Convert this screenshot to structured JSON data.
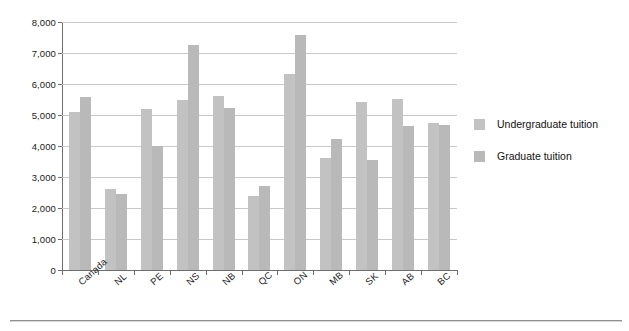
{
  "chart_data": {
    "type": "bar",
    "title": "",
    "subtitle": "",
    "xlabel": "",
    "ylabel": "",
    "ylim": [
      0,
      8000
    ],
    "ytick_labels": [
      "8,000",
      "7,000",
      "6,000",
      "5,000",
      "4,000",
      "3,000",
      "2,000",
      "1,000",
      "0"
    ],
    "ytick_values": [
      8000,
      7000,
      6000,
      5000,
      4000,
      3000,
      2000,
      1000,
      0
    ],
    "grid": true,
    "grid_axis": "y",
    "legend_position": "right",
    "categories": [
      "Canada",
      "NL",
      "PE",
      "NS",
      "NB",
      "QC",
      "ON",
      "MB",
      "SK",
      "AB",
      "BC"
    ],
    "series": [
      {
        "name": "Undergraduate tuition",
        "color": "#c2c2c2",
        "values": [
          5100,
          2610,
          5180,
          5480,
          5620,
          2400,
          6320,
          3600,
          5430,
          5530,
          4740
        ]
      },
      {
        "name": "Graduate tuition",
        "color": "#b9b9b9",
        "values": [
          5570,
          2450,
          4010,
          7250,
          5240,
          2700,
          7580,
          4220,
          3550,
          4640,
          4680
        ]
      }
    ]
  },
  "legend": {
    "items": [
      {
        "label": "Undergraduate tuition",
        "color": "#c2c2c2"
      },
      {
        "label": "Graduate tuition",
        "color": "#b9b9b9"
      }
    ]
  },
  "axes": {
    "y": {
      "min": 0,
      "max": 8000,
      "step": 1000
    }
  }
}
